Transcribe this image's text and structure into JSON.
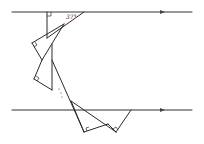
{
  "diagram": {
    "type": "geometry",
    "parallel_lines": [
      {
        "name": "top-line",
        "y": 12,
        "x_start": 12,
        "x_end": 192,
        "arrow_x": 163
      },
      {
        "name": "bottom-line",
        "y": 110,
        "x_start": 12,
        "x_end": 192,
        "arrow_x": 163
      }
    ],
    "angle_label": "37°",
    "ellipsis": "⋮",
    "colors": {
      "stroke": "#2a2a2a",
      "background": "#ffffff"
    }
  }
}
